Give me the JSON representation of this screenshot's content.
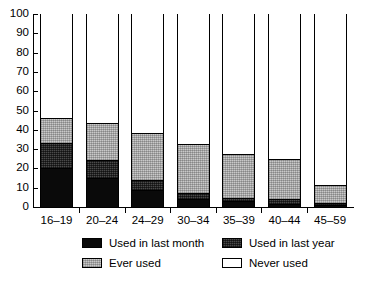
{
  "chart_data": {
    "type": "bar",
    "stacked": true,
    "title": "",
    "subtitle": "",
    "xlabel": "",
    "ylabel": "",
    "ylim": [
      0,
      100
    ],
    "yticks": [
      0,
      10,
      20,
      30,
      40,
      50,
      60,
      70,
      80,
      90,
      100
    ],
    "ytick_labels": [
      "0",
      "10",
      "20",
      "30",
      "40",
      "50",
      "60",
      "70",
      "80",
      "90",
      "100"
    ],
    "grid": false,
    "legend_position": "bottom",
    "categories": [
      "16–19",
      "20–24",
      "24–29",
      "30–34",
      "35–39",
      "40–44",
      "45–59"
    ],
    "series": [
      {
        "name": "Used in last month",
        "color": "#0a0a0a",
        "values": [
          20,
          15,
          9,
          4,
          3,
          1.5,
          1
        ]
      },
      {
        "name": "Used in last year",
        "color": "#4a4a4a",
        "values": [
          13,
          9.5,
          5,
          3,
          1.5,
          2.5,
          1
        ]
      },
      {
        "name": "Ever used",
        "color": "#c9c9c9",
        "values": [
          13,
          19,
          24.5,
          25.5,
          23,
          21,
          9.5
        ]
      },
      {
        "name": "Never used",
        "color": "#ffffff",
        "values": [
          54,
          56.5,
          61.5,
          67.5,
          72.5,
          75,
          88.5
        ]
      }
    ],
    "cumulative_tops": [
      [
        20,
        33,
        46,
        100
      ],
      [
        15,
        24.5,
        43.5,
        100
      ],
      [
        9,
        14,
        38.5,
        100
      ],
      [
        4,
        7,
        32.5,
        100
      ],
      [
        3,
        4.5,
        27.5,
        100
      ],
      [
        1.5,
        4,
        25,
        100
      ],
      [
        1,
        2,
        11.5,
        100
      ]
    ]
  },
  "legend": {
    "items": [
      {
        "label": "Used in last month",
        "swatch": "black-swatch"
      },
      {
        "label": "Used in last year",
        "swatch": "dark-gray-swatch"
      },
      {
        "label": "Ever used",
        "swatch": "light-gray-swatch"
      },
      {
        "label": "Never used",
        "swatch": "white-swatch"
      }
    ]
  }
}
